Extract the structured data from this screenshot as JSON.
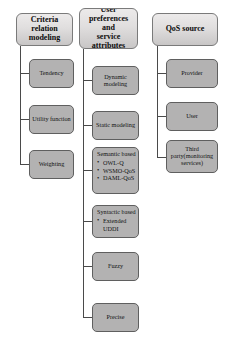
{
  "diagram": {
    "type": "tree-taxonomy",
    "columns": [
      {
        "id": "criteria-relation-modeling",
        "header": "Criteria\nrelation\nmodeling",
        "children": [
          {
            "id": "tendency",
            "label": "Tendency"
          },
          {
            "id": "utility-function",
            "label": "Utility function"
          },
          {
            "id": "weighting",
            "label": "Weighting"
          }
        ]
      },
      {
        "id": "user-preferences-and-service-attributes",
        "header": "User\npreferences and\nservice\nattributes",
        "children": [
          {
            "id": "dynamic-modeling",
            "label": "Dynamic\nmodeling"
          },
          {
            "id": "static-modeling",
            "label": "Static modeling"
          },
          {
            "id": "semantic-based",
            "label": "Semantic based",
            "bullets": [
              "OWL-Q",
              "WSMO-QoS",
              "DAML-QoS"
            ]
          },
          {
            "id": "syntactic-based",
            "label": "Syntactic based",
            "bullets": [
              "Extended\nUDDI"
            ]
          },
          {
            "id": "fuzzy",
            "label": "Fuzzy"
          },
          {
            "id": "precise",
            "label": "Precise"
          }
        ]
      },
      {
        "id": "qos-source",
        "header": "QoS source",
        "children": [
          {
            "id": "provider",
            "label": "Provider"
          },
          {
            "id": "user",
            "label": "User"
          },
          {
            "id": "third-party",
            "label": "Third\nparty(monitoring\nservices)"
          }
        ]
      }
    ]
  },
  "colors": {
    "background": "#ffffff",
    "header_box_top": "#eceaea",
    "header_box_bottom": "#c8c6c6",
    "child_box_fill": "#b3b2b2",
    "box_border": "#5f5f5f",
    "connector_line": "#4a4a4a",
    "text": "#111111"
  }
}
